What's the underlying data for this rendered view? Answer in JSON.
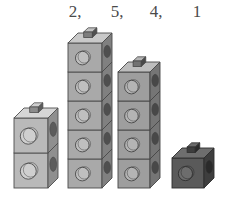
{
  "scene": {
    "title": "Unit cube towers with counts",
    "background_color": "#ffffff",
    "baseline_y": 188
  },
  "labels": {
    "items": [
      {
        "text": "2,",
        "x": 62
      },
      {
        "text": "5,",
        "x": 104
      },
      {
        "text": "4,",
        "x": 143
      },
      {
        "text": "1",
        "x": 184
      }
    ],
    "color": "#4a4a4a",
    "font_size": 17
  },
  "towers": [
    {
      "name": "tower-1",
      "count": 2,
      "count_label": "2,",
      "x": 14,
      "base_y": 188,
      "cube_w": 34,
      "cube_h": 35,
      "depth_x": 10,
      "depth_y": 10,
      "front_color": "#b9b9b9",
      "side_color": "#8f8f8f",
      "top_color": "#d6d6d6",
      "stud_top_color": "#cfcfcf",
      "stud_side_color": "#8c8c8c",
      "front_circle_color": "#cfcfcf",
      "side_oval_color": "#5c5c5c",
      "outline_color": "#4e4e4e"
    },
    {
      "name": "tower-2",
      "count": 5,
      "count_label": "5,",
      "x": 68,
      "base_y": 188,
      "cube_w": 34,
      "cube_h": 29,
      "depth_x": 10,
      "depth_y": 10,
      "front_color": "#a9a9a9",
      "side_color": "#808080",
      "top_color": "#c9c9c9",
      "stud_top_color": "#c2c2c2",
      "stud_side_color": "#7d7d7d",
      "front_circle_color": "#bfbfbf",
      "side_oval_color": "#4f4f4f",
      "outline_color": "#4a4a4a"
    },
    {
      "name": "tower-3",
      "count": 4,
      "count_label": "4,",
      "x": 118,
      "base_y": 188,
      "cube_w": 32,
      "cube_h": 29,
      "depth_x": 10,
      "depth_y": 10,
      "front_color": "#9e9e9e",
      "side_color": "#757575",
      "top_color": "#bdbdbd",
      "stud_top_color": "#b5b5b5",
      "stud_side_color": "#727272",
      "front_circle_color": "#b4b4b4",
      "side_oval_color": "#484848",
      "outline_color": "#464646"
    },
    {
      "name": "tower-4",
      "count": 1,
      "count_label": "1",
      "x": 172,
      "base_y": 188,
      "cube_w": 32,
      "cube_h": 30,
      "depth_x": 10,
      "depth_y": 10,
      "front_color": "#5a5a5a",
      "side_color": "#3e3e3e",
      "top_color": "#6e6e6e",
      "stud_top_color": "#6a6a6a",
      "stud_side_color": "#3d3d3d",
      "front_circle_color": "#6d6d6d",
      "side_oval_color": "#2a2a2a",
      "outline_color": "#2e2e2e"
    }
  ]
}
